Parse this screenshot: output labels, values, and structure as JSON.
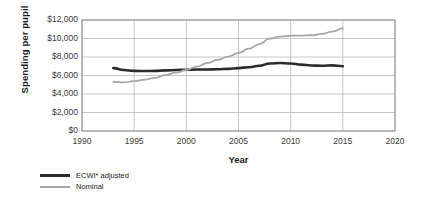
{
  "chart_data": {
    "type": "line",
    "title": "",
    "xlabel": "Year",
    "ylabel": "Spending per pupil",
    "xlim": [
      1990,
      2020
    ],
    "ylim": [
      0,
      12000
    ],
    "grid": true,
    "legend_position": "bottom-left",
    "xticks": [
      1990,
      1995,
      2000,
      2005,
      2010,
      2015,
      2020
    ],
    "xtick_labels": [
      "1990",
      "1995",
      "2000",
      "2005",
      "2010",
      "2015",
      "2020"
    ],
    "yticks": [
      0,
      2000,
      4000,
      6000,
      8000,
      10000,
      12000
    ],
    "ytick_labels": [
      "$0",
      "$2,000",
      "$4,000",
      "$6,000",
      "$8,000",
      "$10,000",
      "$12,000"
    ],
    "series": [
      {
        "name": "ECWI* adjusted",
        "color": "#2b2b2b",
        "width": 2.6,
        "x": [
          1993,
          1994,
          1995,
          1996,
          1997,
          1998,
          1999,
          2000,
          2001,
          2002,
          2003,
          2004,
          2005,
          2006,
          2007,
          2008,
          2009,
          2010,
          2011,
          2012,
          2013,
          2014,
          2015
        ],
        "values": [
          6800,
          6600,
          6500,
          6480,
          6500,
          6550,
          6600,
          6620,
          6650,
          6650,
          6680,
          6720,
          6800,
          6900,
          7050,
          7300,
          7350,
          7300,
          7180,
          7080,
          7060,
          7100,
          7000
        ]
      },
      {
        "name": "Nominal",
        "color": "#a6a6a6",
        "width": 1.8,
        "x": [
          1993,
          1994,
          1995,
          1996,
          1997,
          1998,
          1999,
          2000,
          2001,
          2002,
          2003,
          2004,
          2005,
          2006,
          2007,
          2008,
          2009,
          2010,
          2011,
          2012,
          2013,
          2014,
          2015
        ],
        "values": [
          5300,
          5250,
          5400,
          5550,
          5750,
          6050,
          6300,
          6600,
          6950,
          7350,
          7700,
          8050,
          8450,
          8900,
          9400,
          10000,
          10200,
          10300,
          10320,
          10350,
          10500,
          10750,
          11100
        ]
      }
    ]
  },
  "legend": {
    "items": [
      {
        "label": "ECWI* adjusted"
      },
      {
        "label": "Nominal"
      }
    ]
  }
}
